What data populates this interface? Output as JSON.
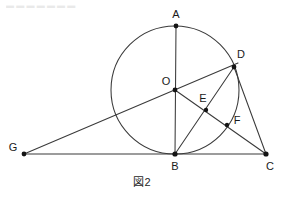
{
  "figure": {
    "caption": "図2",
    "top_artifact_text": "▬ ▬ ▬  ▬ ▬  ▬ ▬",
    "stroke_color": "#3a3a3a",
    "label_color": "#1a1a1a",
    "dot_color": "#141414",
    "background_color": "#ffffff",
    "viewbox": "0 0 284 197"
  },
  "geometry": {
    "circle": {
      "cx": 175,
      "cy": 90,
      "r": 64
    },
    "points": [
      {
        "id": "A",
        "label": "A",
        "x": 176,
        "y": 26,
        "lx": 176,
        "ly": 18,
        "dot": true
      },
      {
        "id": "D",
        "label": "D",
        "x": 234,
        "y": 67,
        "lx": 241,
        "ly": 58,
        "dot": true
      },
      {
        "id": "O",
        "label": "O",
        "x": 175,
        "y": 90,
        "lx": 166,
        "ly": 85,
        "dot": true
      },
      {
        "id": "E",
        "label": "E",
        "x": 206,
        "y": 110,
        "lx": 203,
        "ly": 102,
        "dot": true
      },
      {
        "id": "F",
        "label": "F",
        "x": 227,
        "y": 125,
        "lx": 237,
        "ly": 124,
        "dot": true
      },
      {
        "id": "G",
        "label": "G",
        "x": 24,
        "y": 154,
        "lx": 13,
        "ly": 151,
        "dot": true
      },
      {
        "id": "B",
        "label": "B",
        "x": 175,
        "y": 154,
        "lx": 175,
        "ly": 170,
        "dot": true
      },
      {
        "id": "C",
        "label": "C",
        "x": 266,
        "y": 154,
        "lx": 270,
        "ly": 170,
        "dot": true
      }
    ],
    "segments": [
      {
        "id": "GD",
        "name": "segment-g-d",
        "x1": 24,
        "y1": 154,
        "x2": 238,
        "y2": 63
      },
      {
        "id": "GC",
        "name": "segment-g-c",
        "x1": 24,
        "y1": 154,
        "x2": 266,
        "y2": 154
      },
      {
        "id": "AB",
        "name": "segment-a-b",
        "x1": 176,
        "y1": 26,
        "x2": 175,
        "y2": 154
      },
      {
        "id": "OC",
        "name": "segment-o-c",
        "x1": 175,
        "y1": 90,
        "x2": 266,
        "y2": 154
      },
      {
        "id": "DB",
        "name": "segment-d-b",
        "x1": 234,
        "y1": 67,
        "x2": 175,
        "y2": 154
      },
      {
        "id": "DC",
        "name": "segment-d-c",
        "x1": 234,
        "y1": 67,
        "x2": 266,
        "y2": 154
      }
    ]
  }
}
